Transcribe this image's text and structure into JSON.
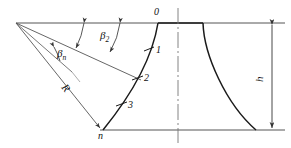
{
  "figure": {
    "background_color": "#ffffff",
    "line_color": "#1a1a1a",
    "thin_line_color": "#555555",
    "width": 291,
    "height": 148
  },
  "labels": {
    "station_0": "0",
    "station_1": "1",
    "station_2": "2",
    "station_3": "3",
    "station_n": "n",
    "angle_beta2": "β",
    "angle_beta2_sub": "2",
    "angle_beta_n": "β",
    "angle_beta_n_sub": "n",
    "radius_R": "R",
    "height_h": "h"
  },
  "geometry": {
    "apex": {
      "x": 16,
      "y": 23
    },
    "top_line_y": 23,
    "bottom_line_y": 130,
    "center_line_x": 178,
    "dimension_line_x": 272,
    "left_profile_top": {
      "x": 158,
      "y": 23
    },
    "left_profile_bottom": {
      "x": 103,
      "y": 130
    },
    "right_profile_top": {
      "x": 203,
      "y": 23
    },
    "right_profile_bottom": {
      "x": 256,
      "y": 130
    },
    "stations": [
      {
        "name": "0",
        "x": 158,
        "y": 23
      },
      {
        "name": "1",
        "x": 148,
        "y": 52
      },
      {
        "name": "2",
        "x": 138,
        "y": 79
      },
      {
        "name": "3",
        "x": 121,
        "y": 107
      },
      {
        "name": "n",
        "x": 103,
        "y": 130
      }
    ]
  }
}
